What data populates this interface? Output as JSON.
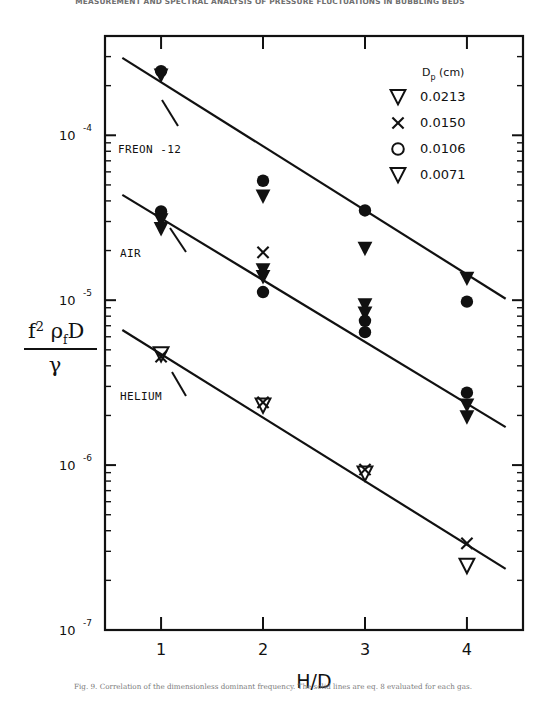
{
  "running_head": "MEASUREMENT AND SPECTRAL ANALYSIS OF PRESSURE FLUCTUATIONS IN BUBBLING BEDS",
  "caption": "Fig. 9. Correlation of the dimensionless dominant frequency. The solid lines are eq. 8 evaluated for each gas.",
  "axes": {
    "x_title": "H/D",
    "y_title_numerator": "f²ρ D",
    "y_title_numerator_sub": "f",
    "y_title_numerator_sup": "2",
    "y_title_denominator": "γ",
    "x_ticks": [
      "1",
      "2",
      "3",
      "4"
    ],
    "y_ticks": [
      "10⁻⁴",
      "10⁻⁵",
      "10⁻⁶",
      "10⁻⁷"
    ],
    "y_tick_mantissa": "10",
    "y_tick_exponents": [
      "-4",
      "-5",
      "-6",
      "-7"
    ]
  },
  "legend": {
    "title": "D",
    "title_sub": "p",
    "title_units": "(cm)",
    "entries": [
      {
        "symbol": "triangle-down-open",
        "label": "0.0213"
      },
      {
        "symbol": "cross",
        "label": "0.0150"
      },
      {
        "symbol": "circle-open",
        "label": "0.0106"
      },
      {
        "symbol": "triangle-down-open",
        "label": "0.0071"
      }
    ]
  },
  "series_labels": [
    {
      "name": "freon-12",
      "text": "FREON -12"
    },
    {
      "name": "air",
      "text": "AIR"
    },
    {
      "name": "helium",
      "text": "HELIUM"
    }
  ],
  "chart_data": {
    "type": "scatter",
    "title": "",
    "xlabel": "H/D",
    "ylabel": "f^2 rho_f D / gamma",
    "xlim": [
      0.45,
      4.55
    ],
    "ylim": [
      1e-07,
      0.0004
    ],
    "yscale": "log",
    "xscale": "linear",
    "grid": false,
    "legend_position": "top-right",
    "legend_title": "Dp (cm)",
    "legend_entries": [
      "0.0213",
      "0.0150",
      "0.0106",
      "0.0071"
    ],
    "annotations": [
      "FREON -12",
      "AIR",
      "HELIUM"
    ],
    "series": [
      {
        "name": "FREON -12",
        "marker": "filled",
        "fit_line": {
          "x": [
            0.62,
            4.38
          ],
          "y": [
            0.000295,
            1.02e-05
          ]
        },
        "points": [
          {
            "x": 1.0,
            "y": 0.000245,
            "marker": "circle-filled"
          },
          {
            "x": 1.0,
            "y": 0.00023,
            "marker": "triangle-down-filled"
          },
          {
            "x": 2.0,
            "y": 5.3e-05,
            "marker": "circle-filled"
          },
          {
            "x": 2.0,
            "y": 4.25e-05,
            "marker": "triangle-down-filled"
          },
          {
            "x": 3.0,
            "y": 3.5e-05,
            "marker": "circle-filled"
          },
          {
            "x": 3.0,
            "y": 2.05e-05,
            "marker": "triangle-down-filled"
          },
          {
            "x": 4.0,
            "y": 1.35e-05,
            "marker": "triangle-down-filled"
          },
          {
            "x": 4.0,
            "y": 9.8e-06,
            "marker": "circle-filled"
          }
        ]
      },
      {
        "name": "AIR",
        "marker": "filled",
        "fit_line": {
          "x": [
            0.62,
            4.38
          ],
          "y": [
            4.35e-05,
            1.7e-06
          ]
        },
        "points": [
          {
            "x": 1.0,
            "y": 3.45e-05,
            "marker": "circle-filled"
          },
          {
            "x": 1.0,
            "y": 3.05e-05,
            "marker": "triangle-down-filled"
          },
          {
            "x": 1.0,
            "y": 2.7e-05,
            "marker": "triangle-down-filled"
          },
          {
            "x": 2.0,
            "y": 1.95e-05,
            "marker": "cross"
          },
          {
            "x": 2.0,
            "y": 1.52e-05,
            "marker": "triangle-down-filled"
          },
          {
            "x": 2.0,
            "y": 1.38e-05,
            "marker": "triangle-down-filled"
          },
          {
            "x": 2.0,
            "y": 1.12e-05,
            "marker": "circle-filled"
          },
          {
            "x": 3.0,
            "y": 9.3e-06,
            "marker": "triangle-down-filled"
          },
          {
            "x": 3.0,
            "y": 8.3e-06,
            "marker": "triangle-down-filled"
          },
          {
            "x": 3.0,
            "y": 7.5e-06,
            "marker": "circle-filled"
          },
          {
            "x": 3.0,
            "y": 6.4e-06,
            "marker": "circle-filled"
          },
          {
            "x": 4.0,
            "y": 2.75e-06,
            "marker": "circle-filled"
          },
          {
            "x": 4.0,
            "y": 2.3e-06,
            "marker": "triangle-down-filled"
          },
          {
            "x": 4.0,
            "y": 1.95e-06,
            "marker": "triangle-down-filled"
          }
        ]
      },
      {
        "name": "HELIUM",
        "marker": "open",
        "fit_line": {
          "x": [
            0.62,
            4.38
          ],
          "y": [
            6.6e-06,
            2.35e-07
          ]
        },
        "points": [
          {
            "x": 1.0,
            "y": 4.7e-06,
            "marker": "triangle-down-open"
          },
          {
            "x": 1.0,
            "y": 4.55e-06,
            "marker": "cross"
          },
          {
            "x": 2.0,
            "y": 2.3e-06,
            "marker": "triangle-down-open"
          },
          {
            "x": 2.0,
            "y": 2.4e-06,
            "marker": "cross"
          },
          {
            "x": 3.0,
            "y": 8.9e-07,
            "marker": "triangle-down-open"
          },
          {
            "x": 3.0,
            "y": 9.4e-07,
            "marker": "cross"
          },
          {
            "x": 4.0,
            "y": 3.35e-07,
            "marker": "cross"
          },
          {
            "x": 4.0,
            "y": 2.45e-07,
            "marker": "triangle-down-open"
          }
        ]
      }
    ]
  }
}
